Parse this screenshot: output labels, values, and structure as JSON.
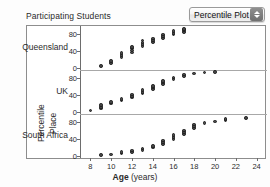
{
  "header": {
    "title": "Participating Students",
    "plot_type_selector": {
      "value": "Percentile Plot",
      "stepper_icon": "up-down-stepper-icon"
    }
  },
  "axes": {
    "y_axis_titles": [
      "Percentile",
      "Place"
    ],
    "x_axis_title_bold": "Age",
    "x_axis_title_unit": "(years)",
    "x_ticks": [
      8,
      10,
      12,
      14,
      16,
      18,
      20,
      22,
      24
    ],
    "x_range": [
      7,
      25
    ],
    "y_ticks": [
      0,
      40,
      80
    ],
    "y_range": [
      -5,
      100
    ]
  },
  "chart_data": {
    "type": "scatter",
    "title": "Participating Students",
    "xlabel": "Age (years)",
    "ylabel": "Percentile",
    "xlim": [
      7,
      25
    ],
    "ylim": [
      -5,
      100
    ],
    "grid": false,
    "legend": "none",
    "facet_variable": "Place",
    "panels": [
      {
        "name": "Queensland",
        "yticks": [
          0,
          40,
          80
        ],
        "points": [
          {
            "x": 9,
            "y": 4
          },
          {
            "x": 10,
            "y": 12
          },
          {
            "x": 10,
            "y": 16
          },
          {
            "x": 11,
            "y": 26
          },
          {
            "x": 11,
            "y": 31
          },
          {
            "x": 11,
            "y": 35
          },
          {
            "x": 12,
            "y": 37
          },
          {
            "x": 12,
            "y": 42
          },
          {
            "x": 12,
            "y": 46
          },
          {
            "x": 12,
            "y": 50
          },
          {
            "x": 13,
            "y": 52
          },
          {
            "x": 13,
            "y": 57
          },
          {
            "x": 13,
            "y": 61
          },
          {
            "x": 13,
            "y": 65
          },
          {
            "x": 14,
            "y": 62
          },
          {
            "x": 14,
            "y": 66
          },
          {
            "x": 14,
            "y": 70
          },
          {
            "x": 15,
            "y": 72
          },
          {
            "x": 15,
            "y": 76
          },
          {
            "x": 15,
            "y": 80
          },
          {
            "x": 16,
            "y": 80
          },
          {
            "x": 16,
            "y": 84
          },
          {
            "x": 16,
            "y": 88
          },
          {
            "x": 17,
            "y": 86
          },
          {
            "x": 17,
            "y": 90
          },
          {
            "x": 17,
            "y": 93
          }
        ]
      },
      {
        "name": "UK",
        "yticks": [
          0,
          40,
          80
        ],
        "points": [
          {
            "x": 8,
            "y": 3
          },
          {
            "x": 9,
            "y": 8
          },
          {
            "x": 9,
            "y": 12
          },
          {
            "x": 9,
            "y": 16
          },
          {
            "x": 10,
            "y": 20
          },
          {
            "x": 10,
            "y": 24
          },
          {
            "x": 11,
            "y": 27
          },
          {
            "x": 11,
            "y": 31
          },
          {
            "x": 12,
            "y": 34
          },
          {
            "x": 12,
            "y": 38
          },
          {
            "x": 12,
            "y": 42
          },
          {
            "x": 13,
            "y": 44
          },
          {
            "x": 13,
            "y": 48
          },
          {
            "x": 13,
            "y": 52
          },
          {
            "x": 14,
            "y": 54
          },
          {
            "x": 14,
            "y": 58
          },
          {
            "x": 14,
            "y": 62
          },
          {
            "x": 15,
            "y": 66
          },
          {
            "x": 15,
            "y": 70
          },
          {
            "x": 15,
            "y": 74
          },
          {
            "x": 16,
            "y": 78
          },
          {
            "x": 16,
            "y": 82
          },
          {
            "x": 17,
            "y": 86
          },
          {
            "x": 17,
            "y": 89
          },
          {
            "x": 18,
            "y": 92
          },
          {
            "x": 19,
            "y": 94
          },
          {
            "x": 20,
            "y": 95
          }
        ]
      },
      {
        "name": "South Africa",
        "yticks": [
          0,
          40,
          80
        ],
        "points": [
          {
            "x": 9,
            "y": 2
          },
          {
            "x": 10,
            "y": 3
          },
          {
            "x": 11,
            "y": 6
          },
          {
            "x": 11,
            "y": 9
          },
          {
            "x": 12,
            "y": 10
          },
          {
            "x": 12,
            "y": 13
          },
          {
            "x": 13,
            "y": 14
          },
          {
            "x": 13,
            "y": 18
          },
          {
            "x": 14,
            "y": 20
          },
          {
            "x": 14,
            "y": 24
          },
          {
            "x": 15,
            "y": 28
          },
          {
            "x": 15,
            "y": 33
          },
          {
            "x": 15,
            "y": 37
          },
          {
            "x": 16,
            "y": 40
          },
          {
            "x": 16,
            "y": 45
          },
          {
            "x": 16,
            "y": 50
          },
          {
            "x": 17,
            "y": 52
          },
          {
            "x": 17,
            "y": 57
          },
          {
            "x": 17,
            "y": 61
          },
          {
            "x": 18,
            "y": 66
          },
          {
            "x": 18,
            "y": 71
          },
          {
            "x": 18,
            "y": 75
          },
          {
            "x": 19,
            "y": 78
          },
          {
            "x": 20,
            "y": 82
          },
          {
            "x": 21,
            "y": 85
          },
          {
            "x": 21,
            "y": 88
          },
          {
            "x": 23,
            "y": 90
          }
        ]
      }
    ]
  }
}
